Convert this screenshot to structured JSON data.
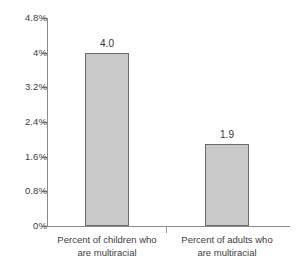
{
  "chart_data": {
    "type": "bar",
    "title": "",
    "subtitle": "",
    "xlabel": "",
    "ylabel": "",
    "categories": [
      "Percent of children who are multiracial",
      "Percent of adults who are multiracial"
    ],
    "category_lines": [
      [
        "Percent of children who",
        "are multiracial"
      ],
      [
        "Percent of adults who",
        "are multiracial"
      ]
    ],
    "values": [
      4.0,
      1.9
    ],
    "data_labels": [
      "4.0",
      "1.9"
    ],
    "ylim": [
      0,
      4.8
    ],
    "ytick_values": [
      0,
      0.8,
      1.6,
      2.4,
      3.2,
      4.0,
      4.8
    ],
    "ytick_labels": [
      "0%",
      "0.8%",
      "1.6%",
      "2.4%",
      "3.2%",
      "4%",
      "4.8%"
    ],
    "grid": false,
    "legend": false,
    "legend_position": "none",
    "colors": {
      "bar_fill": "#c9c9c9",
      "bar_border": "#6b6b6b",
      "axis": "#8a8a8a",
      "text": "#3d3d3d",
      "background": "#ffffff"
    }
  }
}
